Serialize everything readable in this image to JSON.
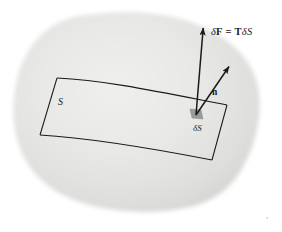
{
  "figure": {
    "background_color": "#ffffff",
    "blob_color": "#e4e4e2",
    "blob_edge_color": "#f2f2f0",
    "line_color": "#1a1a1a",
    "patch_fill_color": "#9a9a9a"
  },
  "labels": {
    "force_vector": {
      "delta": "δ",
      "f": "F",
      "equals": "=",
      "t": "T",
      "delta2": "δ",
      "s": "S",
      "full_text": "δF = T δS"
    },
    "normal_vector": "n",
    "element_area": "δS",
    "surface": "S"
  },
  "elements": {
    "body_blob": "body-blob",
    "surface_patch": "surface-s",
    "area_element": "area-element-delta-s",
    "force_arrow": "force-vector-arrow",
    "normal_arrow": "normal-vector-arrow",
    "corner_mark": "•"
  },
  "geometry": {
    "force_arrow_start": [
      196,
      114
    ],
    "force_arrow_end": [
      203,
      26
    ],
    "normal_arrow_start": [
      196,
      114
    ],
    "normal_arrow_end": [
      230,
      65
    ],
    "element_center": [
      196,
      114
    ]
  }
}
